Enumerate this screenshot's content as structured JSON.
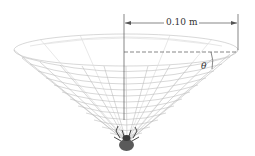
{
  "figure": {
    "type": "physics-diagram",
    "dimension_label": "0.10 m",
    "angle_label": "θ",
    "colors": {
      "web": "#b8b8b8",
      "dimension_lines": "#555555",
      "spider": "#555555"
    }
  }
}
